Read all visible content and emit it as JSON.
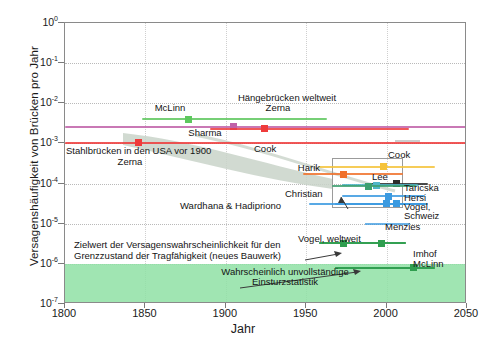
{
  "chart_data": {
    "type": "scatter",
    "title": "",
    "xlabel": "Jahr",
    "ylabel": "Versagenshäufigkeit von Brücken pro Jahr",
    "xlim": [
      1800,
      2050
    ],
    "ylim": [
      1e-07,
      1
    ],
    "yscale": "log",
    "grid": true,
    "legend": "none",
    "xticks": [
      "1800",
      "1850",
      "1900",
      "1950",
      "2000",
      "2050"
    ],
    "yticks": [
      {
        "mantissa": "10",
        "exp": "0"
      },
      {
        "mantissa": "10",
        "exp": "-1"
      },
      {
        "mantissa": "10",
        "exp": "-2"
      },
      {
        "mantissa": "10",
        "exp": "-3"
      },
      {
        "mantissa": "10",
        "exp": "-4"
      },
      {
        "mantissa": "10",
        "exp": "-5"
      },
      {
        "mantissa": "10",
        "exp": "-6"
      },
      {
        "mantissa": "10",
        "exp": "-7"
      }
    ],
    "points": [
      {
        "label": "McLinn",
        "x": 1877,
        "y": 0.004,
        "x_lo": 1848,
        "x_hi": 1963,
        "color": "#5ec75e"
      },
      {
        "label": "Sharma",
        "x": 1905,
        "y": 0.0026,
        "x_lo": 1800,
        "x_hi": 2050,
        "color": "#c060a8"
      },
      {
        "label": "Zerna",
        "x": 1924,
        "y": 0.0023,
        "x_lo": 1890,
        "x_hi": 2014,
        "color": "#ef3b3b"
      },
      {
        "label": "Zerna",
        "x": 1846,
        "y": 0.00105,
        "x_lo": 1800,
        "x_hi": 2050,
        "color": "#ef3b3b"
      },
      {
        "label": "Cook",
        "x": 1998,
        "y": 0.00026,
        "x_lo": 1958,
        "x_hi": 2030,
        "color": "#f5c33b"
      },
      {
        "label": "Harik",
        "x": 1973,
        "y": 0.00017,
        "x_lo": 1948,
        "x_hi": 2010,
        "color": "#f0712a"
      },
      {
        "label": "Lee",
        "x": 2006,
        "y": 0.0001,
        "x_lo": 1988,
        "x_hi": 2026,
        "color": "#2b2b2b"
      },
      {
        "label": "Taricska",
        "x": 1994,
        "y": 9e-05,
        "x_lo": 1972,
        "x_hi": 2020,
        "color": "#4fb6c9"
      },
      {
        "label": "Christian",
        "x": 1989,
        "y": 8.6e-05,
        "x_lo": 1966,
        "x_hi": 2018,
        "color": "#3c9f6e"
      },
      {
        "label": "Hersi",
        "x": 2001,
        "y": 4.8e-05,
        "x_lo": 1972,
        "x_hi": 2024,
        "color": "#3b9ae0"
      },
      {
        "label": "Vogel, Schweiz",
        "x": 2006,
        "y": 3.1e-05,
        "x_lo": 1968,
        "x_hi": 2026,
        "color": "#3b9ae0"
      },
      {
        "label": "Wardhana & Hadipriono",
        "x": 2000,
        "y": 3.1e-05,
        "x_lo": 1952,
        "x_hi": 2024,
        "color": "#3b9ae0"
      },
      {
        "label": "Menzies",
        "x": 1997,
        "y": 3.3e-06,
        "x_lo": 1958,
        "x_hi": 2012,
        "color": "#2f9e4f"
      },
      {
        "label": "Vogel, weltweit",
        "x": 1973,
        "y": 3.3e-06,
        "x_lo": 1958,
        "x_hi": 2012,
        "color": "#2f9e4f"
      },
      {
        "label": "Imhof",
        "x": 2017,
        "y": 8e-07,
        "x_lo": 1968,
        "x_hi": 2030,
        "color": "#2f9e4f"
      },
      {
        "label": "McLinn",
        "x": 2017,
        "y": 8e-07,
        "x_lo": 1968,
        "x_hi": 2030,
        "color": "#2f9e4f"
      }
    ],
    "annotations": [
      {
        "name": "mclinn-top",
        "text": "McLinn"
      },
      {
        "name": "haengebruecken",
        "text": "Hängebrücken weltweit"
      },
      {
        "name": "zerna-top",
        "text": "Zerna"
      },
      {
        "name": "sharma",
        "text": "Sharma"
      },
      {
        "name": "stahlbruecken",
        "text": "Stahlbrücken in den USA vor 1900"
      },
      {
        "name": "zerna-bottom",
        "text": "Zerna"
      },
      {
        "name": "cook-left",
        "text": "Cook"
      },
      {
        "name": "cook-right",
        "text": "Cook"
      },
      {
        "name": "harik",
        "text": "Harik"
      },
      {
        "name": "lee",
        "text": "Lee"
      },
      {
        "name": "taricska",
        "text": "Taricska"
      },
      {
        "name": "christian",
        "text": "Christian"
      },
      {
        "name": "hersi",
        "text": "Hersi"
      },
      {
        "name": "vogel-schweiz",
        "text": "Vogel,"
      },
      {
        "name": "vogel-schweiz-2",
        "text": "Schweiz"
      },
      {
        "name": "wardhana",
        "text": "Wardhana & Hadipriono"
      },
      {
        "name": "menzies",
        "text": "Menzies"
      },
      {
        "name": "vogel-weltweit",
        "text": "Vogel, weltweit"
      },
      {
        "name": "imhof",
        "text": "Imhof"
      },
      {
        "name": "mclinn-bottom",
        "text": "McLinn"
      },
      {
        "name": "zielwert-1",
        "text": "Zielwert der Versagenswahrscheinlichkeit für den"
      },
      {
        "name": "zielwert-2",
        "text": "Grenzzustand der Tragfähigkeit (neues Bauwerk)"
      },
      {
        "name": "einsturz-1",
        "text": "Wahrscheinlich unvollständige"
      },
      {
        "name": "einsturz-2",
        "text": "Einsturzstatistik"
      }
    ],
    "colors": {
      "green_band": "#8fe0a5",
      "frame": "#8a8a8a",
      "grid": "#b9b9b9",
      "cone": "#c4cec4"
    }
  }
}
